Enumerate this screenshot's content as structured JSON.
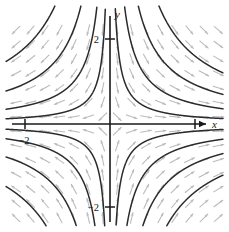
{
  "figure": {
    "title": "",
    "background_color": "#ffffff"
  },
  "axes": {
    "x_axis_label": "x",
    "y_axis_label": "y",
    "x_ticks": [
      {
        "value": -2,
        "label": "−2"
      }
    ],
    "y_ticks": [
      {
        "value": 2,
        "label": "2"
      },
      {
        "value": -2,
        "label": "−2"
      }
    ],
    "origin_px": {
      "x": 110,
      "y": 124
    },
    "pixels_per_unit": 42.5,
    "axis_color": "#1a1a1a",
    "arrow_on_x_axis": true
  },
  "chart_data": {
    "type": "line",
    "title": "",
    "xlabel": "x",
    "ylabel": "y",
    "xlim": [
      -2.6,
      2.8
    ],
    "ylim": [
      -2.6,
      2.6
    ],
    "grid": false,
    "legend": "none",
    "slope_field": {
      "equation": "dy/dx = -y/x",
      "arrow_color": "#b9b9bf",
      "description": "Grid of small gray arrows tangent to the solution curves; arrows point toward the origin along the x-axis directions and away along the y-axis directions.",
      "grid_spacing_units": 0.34
    },
    "curve_color": "#2b2b2b",
    "series": [
      {
        "name": "y = 0.34/x, quadrant I",
        "constant": 0.34,
        "branch": "right"
      },
      {
        "name": "y = 0.95/x, quadrant I",
        "constant": 0.95,
        "branch": "right"
      },
      {
        "name": "y = 1.85/x, quadrant I",
        "constant": 1.85,
        "branch": "right"
      },
      {
        "name": "y = 3.2/x, quadrant I",
        "constant": 3.2,
        "branch": "right"
      },
      {
        "name": "y = -0.34/x, quadrant IV",
        "constant": -0.34,
        "branch": "right"
      },
      {
        "name": "y = -0.95/x, quadrant IV",
        "constant": -0.95,
        "branch": "right"
      },
      {
        "name": "y = -1.85/x, quadrant IV",
        "constant": -1.85,
        "branch": "right"
      },
      {
        "name": "y = -3.2/x, quadrant IV",
        "constant": -3.2,
        "branch": "right"
      },
      {
        "name": "y = -0.30/x, quadrant II",
        "constant": -0.3,
        "branch": "left"
      },
      {
        "name": "y = -0.85/x, quadrant II",
        "constant": -0.85,
        "branch": "left"
      },
      {
        "name": "y = -1.9/x, quadrant II",
        "constant": -1.9,
        "branch": "left"
      },
      {
        "name": "y = -3.6/x, quadrant II",
        "constant": -3.6,
        "branch": "left"
      },
      {
        "name": "y = 0.30/x, quadrant III",
        "constant": 0.3,
        "branch": "left"
      },
      {
        "name": "y = 0.85/x, quadrant III",
        "constant": 0.85,
        "branch": "left"
      },
      {
        "name": "y = 1.9/x, quadrant III",
        "constant": 1.9,
        "branch": "left"
      },
      {
        "name": "y = 3.6/x, quadrant III",
        "constant": 3.6,
        "branch": "left"
      }
    ],
    "separatrices": [
      {
        "name": "x-axis separatrix y = 0",
        "axis": "x"
      }
    ]
  }
}
